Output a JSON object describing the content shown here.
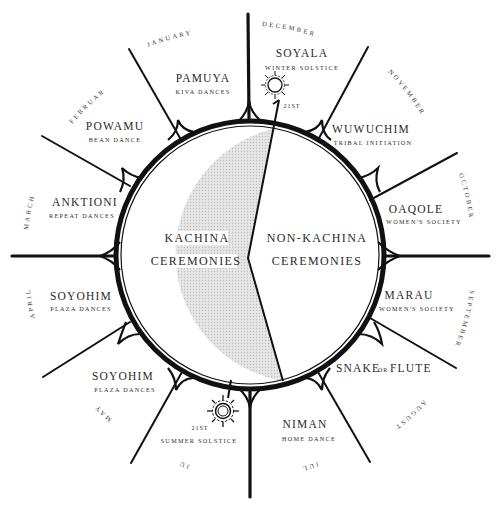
{
  "diagram": {
    "center": {
      "left_label_line1": "KACHINA",
      "left_label_line2": "CEREMONIES",
      "right_label_line1": "NON-KACHINA",
      "right_label_line2": "CEREMONIES"
    },
    "ceremonies": [
      {
        "name": "SOYALA",
        "subtitle": "WINTER SOLSTICE",
        "month": "DECEMBER"
      },
      {
        "name": "WUWUCHIM",
        "subtitle": "TRIBAL INITIATION",
        "month": "NOVEMBER"
      },
      {
        "name": "OAQOLE",
        "subtitle": "WOMEN'S SOCIETY",
        "month": "OCTOBER"
      },
      {
        "name": "MARAU",
        "subtitle": "WOMEN'S SOCIETY",
        "month": "SEPTEMBER"
      },
      {
        "name": "SNAKE",
        "name_connector": "OR",
        "name_tail": "FLUTE",
        "subtitle": "",
        "month": "AUGUST"
      },
      {
        "name": "NIMAN",
        "subtitle": "HOME DANCE",
        "month": "JULY"
      },
      {
        "name": "",
        "subtitle": "SUMMER SOLSTICE",
        "month": "JUNE"
      },
      {
        "name": "SOYOHIM",
        "subtitle": "PLAZA DANCES",
        "month": "MAY"
      },
      {
        "name": "SOYOHIM",
        "subtitle": "PLAZA DANCES",
        "month": "APRIL"
      },
      {
        "name": "ANKTIONI",
        "subtitle": "REPEAT DANCES",
        "month": "MARCH"
      },
      {
        "name": "POWAMU",
        "subtitle": "BEAN DANCE",
        "month": "FEBRUARY"
      },
      {
        "name": "PAMUYA",
        "subtitle": "KIVA DANCES",
        "month": "JANUARY"
      }
    ],
    "solstices": {
      "winter_day": "21ST",
      "summer_day": "21ST"
    },
    "colors": {
      "ink": "#111111",
      "kachina_fill": "#d9d9d9",
      "background": "#ffffff"
    }
  }
}
